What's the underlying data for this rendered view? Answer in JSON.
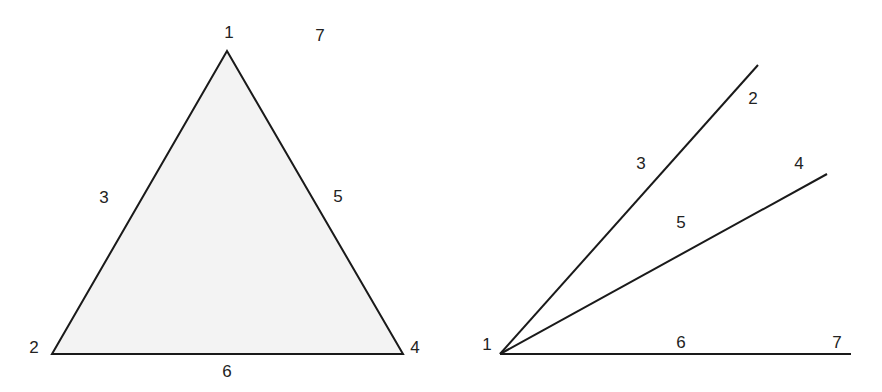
{
  "colors": {
    "stroke": "#1a1a1a",
    "fill": "#f3f3f3",
    "label": "#222222",
    "background": "#ffffff"
  },
  "figures": [
    {
      "name": "triangle",
      "shape": "filled triangle",
      "vertices": {
        "apex": [
          227,
          51
        ],
        "bottom_left": [
          52,
          354
        ],
        "bottom_right": [
          403,
          354
        ]
      },
      "labels": [
        {
          "text": "1",
          "x": 229,
          "y": 32
        },
        {
          "text": "7",
          "x": 320,
          "y": 35
        },
        {
          "text": "3",
          "x": 104,
          "y": 197
        },
        {
          "text": "5",
          "x": 338,
          "y": 196
        },
        {
          "text": "2",
          "x": 34,
          "y": 347
        },
        {
          "text": "4",
          "x": 415,
          "y": 347
        },
        {
          "text": "6",
          "x": 227,
          "y": 371
        }
      ]
    },
    {
      "name": "fan-of-rays",
      "shape": "three rays from a common origin",
      "origin": [
        500,
        354
      ],
      "rays": [
        {
          "end": [
            758,
            65
          ]
        },
        {
          "end": [
            827,
            174
          ]
        },
        {
          "end": [
            851,
            354
          ]
        }
      ],
      "labels": [
        {
          "text": "2",
          "x": 753,
          "y": 98
        },
        {
          "text": "3",
          "x": 641,
          "y": 163
        },
        {
          "text": "4",
          "x": 799,
          "y": 163
        },
        {
          "text": "5",
          "x": 681,
          "y": 222
        },
        {
          "text": "1",
          "x": 487,
          "y": 344
        },
        {
          "text": "6",
          "x": 681,
          "y": 342
        },
        {
          "text": "7",
          "x": 837,
          "y": 342
        }
      ]
    }
  ]
}
